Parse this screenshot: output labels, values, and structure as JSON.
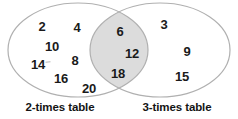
{
  "diagram": {
    "type": "venn",
    "title": "",
    "background_color": "#ffffff",
    "outline_color": "#b0b0b0",
    "intersection_fill": "#dcdcdc",
    "set_fill": "#ffffff",
    "text_color": "#1a1a1a"
  },
  "sets": {
    "left": {
      "label": "2-times table",
      "label_x": 60,
      "label_y": 108,
      "only_values": [
        {
          "value": "2",
          "x": 42,
          "y": 26,
          "size": 13
        },
        {
          "value": "4",
          "x": 77,
          "y": 27,
          "size": 13
        },
        {
          "value": "10",
          "x": 52,
          "y": 46,
          "size": 13
        },
        {
          "value": "8",
          "x": 75,
          "y": 60,
          "size": 13
        },
        {
          "value": "14",
          "x": 38,
          "y": 64,
          "size": 13
        },
        {
          "value": "16",
          "x": 61,
          "y": 78,
          "size": 13
        },
        {
          "value": "20",
          "x": 89,
          "y": 88,
          "size": 13
        }
      ]
    },
    "right": {
      "label": "3-times table",
      "label_x": 177,
      "label_y": 108,
      "only_values": [
        {
          "value": "3",
          "x": 164,
          "y": 24,
          "size": 13
        },
        {
          "value": "9",
          "x": 187,
          "y": 51,
          "size": 13
        },
        {
          "value": "15",
          "x": 182,
          "y": 76,
          "size": 13
        }
      ]
    }
  },
  "intersection": {
    "values": [
      {
        "value": "6",
        "x": 120,
        "y": 31,
        "size": 13
      },
      {
        "value": "12",
        "x": 132,
        "y": 53,
        "size": 13
      },
      {
        "value": "18",
        "x": 118,
        "y": 73,
        "size": 13
      }
    ]
  },
  "geometry": {
    "left_ellipse": {
      "cx": 78,
      "cy": 50,
      "rx": 70,
      "ry": 47
    },
    "right_ellipse": {
      "cx": 160,
      "cy": 50,
      "rx": 70,
      "ry": 47
    },
    "stroke_width": 1.2
  },
  "artifacts": {
    "tick_after_14": {
      "x": 48,
      "y": 62
    }
  }
}
